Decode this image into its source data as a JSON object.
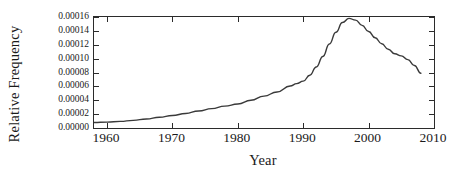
{
  "chart_data": {
    "type": "line",
    "title": "",
    "xlabel": "Year",
    "ylabel": "Relative Frequency",
    "xlim": [
      1958,
      2010
    ],
    "ylim": [
      0.0,
      0.00016
    ],
    "grid": false,
    "legend": null,
    "xticks": [
      1960,
      1970,
      1980,
      1990,
      2000,
      2010
    ],
    "xtick_labels": [
      "1960",
      "1970",
      "1980",
      "1990",
      "2000",
      "2010"
    ],
    "yticks": [
      0.0,
      2e-05,
      4e-05,
      6e-05,
      8e-05,
      0.0001,
      0.00012,
      0.00014,
      0.00016
    ],
    "ytick_labels": [
      "0.00000",
      "0.00002",
      "0.00004",
      "0.00006",
      "0.00008",
      "0.00010",
      "0.00012",
      "0.00014",
      "0.00016"
    ],
    "line_color": "#3a3a3a",
    "line_width": 1.4,
    "series": [
      {
        "name": "Relative Frequency",
        "x": [
          1958,
          1960,
          1962,
          1964,
          1966,
          1968,
          1970,
          1972,
          1974,
          1976,
          1978,
          1980,
          1982,
          1984,
          1986,
          1988,
          1989,
          1990,
          1991,
          1992,
          1993,
          1994,
          1995,
          1996,
          1997,
          1998,
          1999,
          2000,
          2001,
          2002,
          2003,
          2004,
          2005,
          2006,
          2007,
          2008
        ],
        "y": [
          8e-06,
          8.5e-06,
          9.5e-06,
          1.1e-05,
          1.3e-05,
          1.55e-05,
          1.8e-05,
          2.1e-05,
          2.45e-05,
          2.8e-05,
          3.15e-05,
          3.45e-05,
          4e-05,
          4.6e-05,
          5.2e-05,
          6.05e-05,
          6.4e-05,
          6.75e-05,
          7.6e-05,
          8.8e-05,
          0.000103,
          0.000121,
          0.000138,
          0.000152,
          0.000158,
          0.0001555,
          0.000148,
          0.000139,
          0.00013,
          0.0001215,
          0.0001135,
          0.000107,
          0.000104,
          9.85e-05,
          9e-05,
          7.9e-05
        ]
      }
    ]
  }
}
